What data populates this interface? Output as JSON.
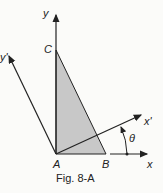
{
  "figure": {
    "caption": "Fig. 8-A",
    "points": {
      "A": "A",
      "B": "B",
      "C": "C"
    },
    "axes": {
      "x": "x",
      "y": "y",
      "x_prime": "x'",
      "y_prime": "y'"
    },
    "angle": "θ",
    "colors": {
      "triangle_fill": "#c8c8c8",
      "stroke": "#222222",
      "background": "#fbfbf9"
    }
  }
}
